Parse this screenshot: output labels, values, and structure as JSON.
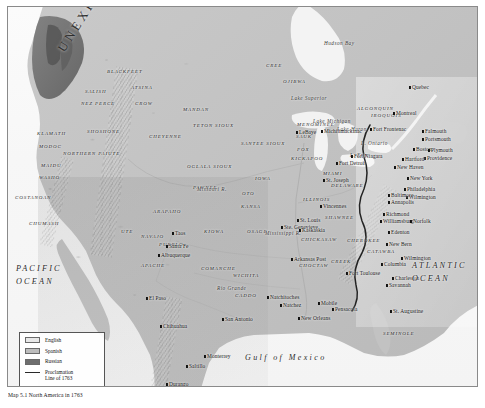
{
  "map": {
    "title_caption": "Map 5.1  North America in 1763",
    "unexplored_label": "UNEXPLORED",
    "oceans": [
      {
        "name": "PACIFIC OCEAN",
        "lines": [
          "PACIFIC",
          "OCEAN"
        ],
        "x": 8,
        "y": 258
      },
      {
        "name": "ATLANTIC OCEAN",
        "lines": [
          "ATLANTIC",
          "OCEAN"
        ],
        "x": 404,
        "y": 255
      },
      {
        "name": "Gulf of Mexico",
        "text": "Gulf of Mexico",
        "x": 243,
        "y": 350
      }
    ],
    "water_features": [
      {
        "label": "Hudson Bay",
        "x": 323,
        "y": 40
      },
      {
        "label": "Lake Superior",
        "x": 290,
        "y": 95
      },
      {
        "label": "Lake Michigan",
        "x": 312,
        "y": 118
      },
      {
        "label": "Lake Huron",
        "x": 336,
        "y": 126
      },
      {
        "label": "L. Erie",
        "x": 349,
        "y": 152
      },
      {
        "label": "L. Ontario",
        "x": 360,
        "y": 140
      },
      {
        "label": "Rio Grande",
        "x": 216,
        "y": 285
      },
      {
        "label": "Mississippi R.",
        "x": 264,
        "y": 230
      },
      {
        "label": "Missouri R.",
        "x": 196,
        "y": 186
      }
    ],
    "tribes": [
      {
        "label": "BLACKFEET",
        "x": 106,
        "y": 68
      },
      {
        "label": "SALISH",
        "x": 84,
        "y": 88
      },
      {
        "label": "NEZ PERCE",
        "x": 80,
        "y": 100
      },
      {
        "label": "ATSINA",
        "x": 130,
        "y": 84
      },
      {
        "label": "CROW",
        "x": 134,
        "y": 100
      },
      {
        "label": "MANDAN",
        "x": 182,
        "y": 106
      },
      {
        "label": "TETON SIOUX",
        "x": 192,
        "y": 122
      },
      {
        "label": "CHEYENNE",
        "x": 148,
        "y": 133
      },
      {
        "label": "SANTEE SIOUX",
        "x": 240,
        "y": 140
      },
      {
        "label": "SHOSHONE",
        "x": 86,
        "y": 128
      },
      {
        "label": "KLAMATH",
        "x": 36,
        "y": 130
      },
      {
        "label": "MODOC",
        "x": 38,
        "y": 143
      },
      {
        "label": "NORTHERN PAIUTE",
        "x": 62,
        "y": 150
      },
      {
        "label": "MAIDU",
        "x": 40,
        "y": 162
      },
      {
        "label": "WASHO",
        "x": 38,
        "y": 174
      },
      {
        "label": "COSTANOAN",
        "x": 14,
        "y": 194
      },
      {
        "label": "CHUMASH",
        "x": 28,
        "y": 220
      },
      {
        "label": "OGLALA SIOUX",
        "x": 186,
        "y": 163
      },
      {
        "label": "PAWNEE",
        "x": 192,
        "y": 184
      },
      {
        "label": "ARAPAHO",
        "x": 152,
        "y": 208
      },
      {
        "label": "OTO",
        "x": 241,
        "y": 190
      },
      {
        "label": "KANSA",
        "x": 240,
        "y": 203
      },
      {
        "label": "IOWA",
        "x": 254,
        "y": 175
      },
      {
        "label": "OSAGE",
        "x": 246,
        "y": 228
      },
      {
        "label": "KIOWA",
        "x": 203,
        "y": 228
      },
      {
        "label": "UTE",
        "x": 120,
        "y": 228
      },
      {
        "label": "NAVAJO",
        "x": 140,
        "y": 233
      },
      {
        "label": "PUEBLO",
        "x": 158,
        "y": 241
      },
      {
        "label": "APACHE",
        "x": 140,
        "y": 262
      },
      {
        "label": "COMANCHE",
        "x": 200,
        "y": 265
      },
      {
        "label": "WICHITA",
        "x": 232,
        "y": 272
      },
      {
        "label": "CADDO",
        "x": 234,
        "y": 292
      },
      {
        "label": "CREE",
        "x": 265,
        "y": 62
      },
      {
        "label": "OJIBWA",
        "x": 282,
        "y": 78
      },
      {
        "label": "ALGONQUIN",
        "x": 356,
        "y": 105
      },
      {
        "label": "MENOMINEE",
        "x": 296,
        "y": 121
      },
      {
        "label": "SAUK",
        "x": 295,
        "y": 133
      },
      {
        "label": "FOX",
        "x": 296,
        "y": 146
      },
      {
        "label": "KICKAPOO",
        "x": 290,
        "y": 155
      },
      {
        "label": "ILLINOIS",
        "x": 302,
        "y": 196
      },
      {
        "label": "MIAMI",
        "x": 322,
        "y": 170
      },
      {
        "label": "DELAWARE",
        "x": 330,
        "y": 182
      },
      {
        "label": "SHAWNEE",
        "x": 324,
        "y": 214
      },
      {
        "label": "IROQUOIS",
        "x": 370,
        "y": 112
      },
      {
        "label": "CHICKASAW",
        "x": 300,
        "y": 236
      },
      {
        "label": "CHOCTAW",
        "x": 298,
        "y": 262
      },
      {
        "label": "CHEROKEE",
        "x": 346,
        "y": 237
      },
      {
        "label": "CREEK",
        "x": 330,
        "y": 258
      },
      {
        "label": "CATAWBA",
        "x": 366,
        "y": 248
      },
      {
        "label": "SEMINOLE",
        "x": 382,
        "y": 330
      }
    ],
    "settlements": [
      {
        "name": "Quebec",
        "x": 411,
        "y": 84,
        "anchor": "left"
      },
      {
        "name": "Montreal",
        "x": 395,
        "y": 110,
        "anchor": "left"
      },
      {
        "name": "Michilimackinac",
        "x": 323,
        "y": 128,
        "anchor": "left"
      },
      {
        "name": "Fort Frontenac",
        "x": 372,
        "y": 126,
        "anchor": "left"
      },
      {
        "name": "Fort Niagara",
        "x": 353,
        "y": 153,
        "anchor": "left"
      },
      {
        "name": "Fort Detroit",
        "x": 338,
        "y": 160,
        "anchor": "left"
      },
      {
        "name": "St. Joseph",
        "x": 325,
        "y": 177,
        "anchor": "left"
      },
      {
        "name": "LeBaye",
        "x": 298,
        "y": 129,
        "anchor": "left"
      },
      {
        "name": "Falmouth",
        "x": 424,
        "y": 128,
        "anchor": "left"
      },
      {
        "name": "Portsmouth",
        "x": 424,
        "y": 136,
        "anchor": "left"
      },
      {
        "name": "Boston",
        "x": 415,
        "y": 146,
        "anchor": "left"
      },
      {
        "name": "Plymouth",
        "x": 430,
        "y": 147,
        "anchor": "left"
      },
      {
        "name": "Providence",
        "x": 426,
        "y": 155,
        "anchor": "left"
      },
      {
        "name": "Hartford",
        "x": 404,
        "y": 156,
        "anchor": "left"
      },
      {
        "name": "New Haven",
        "x": 396,
        "y": 164,
        "anchor": "left"
      },
      {
        "name": "New York",
        "x": 409,
        "y": 175,
        "anchor": "left"
      },
      {
        "name": "Philadelphia",
        "x": 406,
        "y": 186,
        "anchor": "left"
      },
      {
        "name": "Wilmington",
        "x": 408,
        "y": 194,
        "anchor": "left"
      },
      {
        "name": "Baltimore",
        "x": 390,
        "y": 192,
        "anchor": "left"
      },
      {
        "name": "Annapolis",
        "x": 390,
        "y": 199,
        "anchor": "left"
      },
      {
        "name": "Richmond",
        "x": 385,
        "y": 211,
        "anchor": "left"
      },
      {
        "name": "Williamsburg",
        "x": 382,
        "y": 218,
        "anchor": "left"
      },
      {
        "name": "Norfolk",
        "x": 412,
        "y": 218,
        "anchor": "left"
      },
      {
        "name": "Edenton",
        "x": 390,
        "y": 229,
        "anchor": "left"
      },
      {
        "name": "New Bern",
        "x": 388,
        "y": 241,
        "anchor": "left"
      },
      {
        "name": "Wilmington",
        "x": 403,
        "y": 255,
        "anchor": "left"
      },
      {
        "name": "Columbia",
        "x": 383,
        "y": 261,
        "anchor": "left"
      },
      {
        "name": "Charleston",
        "x": 394,
        "y": 275,
        "anchor": "left"
      },
      {
        "name": "Savannah",
        "x": 388,
        "y": 282,
        "anchor": "left"
      },
      {
        "name": "St. Augustine",
        "x": 392,
        "y": 308,
        "anchor": "left"
      },
      {
        "name": "Fort Toulouse",
        "x": 348,
        "y": 270,
        "anchor": "left"
      },
      {
        "name": "Arkansas Post",
        "x": 293,
        "y": 256,
        "anchor": "left"
      },
      {
        "name": "Natchitoches",
        "x": 269,
        "y": 294,
        "anchor": "left"
      },
      {
        "name": "Natchez",
        "x": 282,
        "y": 302,
        "anchor": "left"
      },
      {
        "name": "Mobile",
        "x": 320,
        "y": 300,
        "anchor": "left"
      },
      {
        "name": "Pensacola",
        "x": 334,
        "y": 306,
        "anchor": "left"
      },
      {
        "name": "New Orleans",
        "x": 300,
        "y": 315,
        "anchor": "left"
      },
      {
        "name": "San Antonio",
        "x": 224,
        "y": 316,
        "anchor": "left"
      },
      {
        "name": "St. Louis",
        "x": 299,
        "y": 217,
        "anchor": "left"
      },
      {
        "name": "Ste. Genevieve",
        "x": 283,
        "y": 224,
        "anchor": "left"
      },
      {
        "name": "Kaskaskia",
        "x": 301,
        "y": 227,
        "anchor": "left"
      },
      {
        "name": "Vincennes",
        "x": 322,
        "y": 203,
        "anchor": "left"
      },
      {
        "name": "Taos",
        "x": 174,
        "y": 230,
        "anchor": "left"
      },
      {
        "name": "Santa Fe",
        "x": 168,
        "y": 243,
        "anchor": "left"
      },
      {
        "name": "Albuquerque",
        "x": 160,
        "y": 252,
        "anchor": "left"
      },
      {
        "name": "El Paso",
        "x": 148,
        "y": 295,
        "anchor": "left"
      },
      {
        "name": "Chihuahua",
        "x": 162,
        "y": 323,
        "anchor": "left"
      },
      {
        "name": "Monterrey",
        "x": 206,
        "y": 353,
        "anchor": "left"
      },
      {
        "name": "Saltillo",
        "x": 188,
        "y": 363,
        "anchor": "left"
      },
      {
        "name": "Durango",
        "x": 168,
        "y": 381,
        "anchor": "left"
      }
    ],
    "legend": {
      "title": "",
      "entries": [
        {
          "label": "English",
          "swatch": "english",
          "color": "#e8e8e8"
        },
        {
          "label": "Spanish",
          "swatch": "spanish",
          "color": "#bdbdbd"
        },
        {
          "label": "Russian",
          "swatch": "russian",
          "color": "#6e6e6e"
        }
      ],
      "line_entry": {
        "label_line1": "Proclamation",
        "label_line2": "Line of 1763",
        "color": "#2a2a2a"
      }
    }
  }
}
